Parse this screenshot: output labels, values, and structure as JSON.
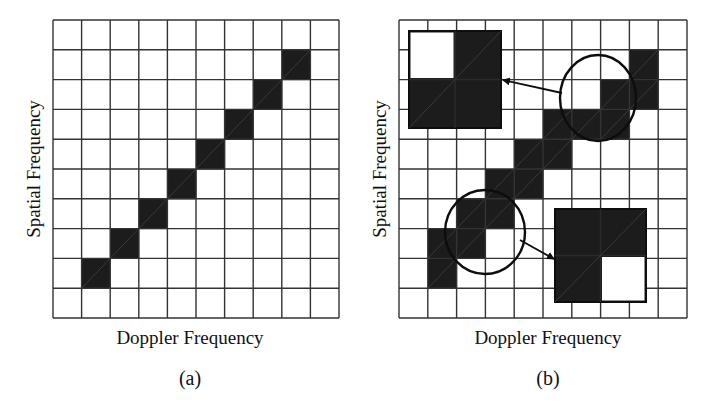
{
  "figure": {
    "width": 704,
    "height": 410,
    "colors": {
      "cell_fill": "#1c1c1c",
      "grid_line": "#333333",
      "background": "#ffffff",
      "annotation": "#0d0d0d"
    },
    "panels": [
      {
        "id": "a",
        "caption": "(a)",
        "xlabel": "Doppler Frequency",
        "ylabel": "Spatial Frequency",
        "grid": {
          "x": 53,
          "y": 20,
          "width": 286,
          "height": 298,
          "cols": 10,
          "rows": 10
        },
        "filled_cells": [
          [
            1,
            8
          ],
          [
            2,
            7
          ],
          [
            3,
            6
          ],
          [
            4,
            5
          ],
          [
            5,
            4
          ],
          [
            6,
            3
          ],
          [
            7,
            2
          ],
          [
            8,
            1
          ]
        ],
        "caption_pos": {
          "x": 190,
          "y": 385
        },
        "xlabel_pos": {
          "x": 190,
          "y": 344
        },
        "ylabel_pos": {
          "x": 40,
          "y": 169
        }
      },
      {
        "id": "b",
        "caption": "(b)",
        "xlabel": "Doppler Frequency",
        "ylabel": "Spatial Frequency",
        "grid": {
          "x": 399,
          "y": 20,
          "width": 288,
          "height": 298,
          "cols": 10,
          "rows": 10
        },
        "filled_cells": [
          [
            1,
            8
          ],
          [
            1,
            7
          ],
          [
            2,
            7
          ],
          [
            2,
            6
          ],
          [
            3,
            6
          ],
          [
            3,
            5
          ],
          [
            4,
            5
          ],
          [
            4,
            4
          ],
          [
            5,
            4
          ],
          [
            5,
            3
          ],
          [
            6,
            3
          ],
          [
            7,
            3
          ],
          [
            7,
            2
          ],
          [
            8,
            2
          ],
          [
            8,
            1
          ]
        ],
        "caption_pos": {
          "x": 548,
          "y": 385
        },
        "xlabel_pos": {
          "x": 548,
          "y": 344
        },
        "ylabel_pos": {
          "x": 386,
          "y": 169
        },
        "circles": [
          {
            "cx": 598,
            "cy": 98,
            "rx": 38,
            "ry": 43
          },
          {
            "cx": 485,
            "cy": 232,
            "rx": 40,
            "ry": 42
          }
        ],
        "insets": [
          {
            "x": 409,
            "y": 31,
            "width": 92,
            "height": 97,
            "white_quadrant": "top-left"
          },
          {
            "x": 555,
            "y": 209,
            "width": 91,
            "height": 93,
            "white_quadrant": "bottom-right"
          }
        ],
        "arrows": [
          {
            "x1": 562,
            "y1": 93,
            "x2": 503,
            "y2": 80
          },
          {
            "x1": 520,
            "y1": 240,
            "x2": 554,
            "y2": 259
          }
        ]
      }
    ]
  }
}
